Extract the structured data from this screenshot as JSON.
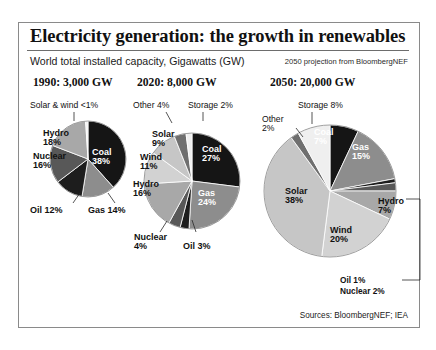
{
  "header": {
    "title": "Electricity generation: the growth in renewables",
    "subtitle": "World total installed capacity, Gigawatts (GW)",
    "note": "2050 projection from BloombergNEF"
  },
  "footer": {
    "sources": "Sources: BloombergNEF; IEA"
  },
  "panels": [
    {
      "heading": "1990: 3,000 GW"
    },
    {
      "heading": "2020: 8,000 GW"
    },
    {
      "heading": "2050: 20,000 GW"
    }
  ],
  "labels": {
    "p0": {
      "solarwind": "Solar & wind <1%",
      "hydro": "Hydro\n18%",
      "hydro_l1": "Hydro",
      "hydro_l2": "18%",
      "nuclear_l1": "Nuclear",
      "nuclear_l2": "16%",
      "oil": "Oil 12%",
      "gas": "Gas 14%",
      "coal_l1": "Coal",
      "coal_l2": "38%"
    },
    "p1": {
      "other": "Other 4%",
      "storage": "Storage 2%",
      "solar_l1": "Solar",
      "solar_l2": "9%",
      "wind_l1": "Wind",
      "wind_l2": "11%",
      "hydro_l1": "Hydro",
      "hydro_l2": "16%",
      "nuclear_l1": "Nuclear",
      "nuclear_l2": "4%",
      "oil": "Oil 3%",
      "gas_l1": "Gas",
      "gas_l2": "24%",
      "coal_l1": "Coal",
      "coal_l2": "27%"
    },
    "p2": {
      "storage": "Storage 8%",
      "other_l1": "Other",
      "other_l2": "2%",
      "solar_l1": "Solar",
      "solar_l2": "38%",
      "wind_l1": "Wind",
      "wind_l2": "20%",
      "hydro_l1": "Hydro",
      "hydro_l2": "7%",
      "oil": "Oil 1%",
      "nuclear": "Nuclear 2%",
      "gas_l1": "Gas",
      "gas_l2": "15%",
      "coal_l1": "Coal",
      "coal_l2": "7%"
    }
  },
  "colors": {
    "coal": "#151515",
    "gas": "#8d8d8d",
    "oil": "#1d1d1d",
    "nuclear": "#585858",
    "hydro": "#a8a8a8",
    "wind": "#d2d2d2",
    "solar": "#c6c6c6",
    "other": "#6f6f6f",
    "storage": "#efefef",
    "solarwind": "#f2f2f2",
    "frame": "#8a8a8a",
    "text": "#111111"
  },
  "chart_data": [
    {
      "type": "pie",
      "title": "1990: 3,000 GW",
      "total_gw": 3000,
      "unit": "GW",
      "categories": [
        "Coal",
        "Gas",
        "Oil",
        "Nuclear",
        "Hydro",
        "Solar & wind"
      ],
      "values": [
        38,
        14,
        12,
        16,
        18,
        1
      ],
      "value_labels": [
        "38%",
        "14%",
        "12%",
        "16%",
        "18%",
        "<1%"
      ],
      "start_angle_deg": 0,
      "direction": "clockwise",
      "legend": "inline-labels"
    },
    {
      "type": "pie",
      "title": "2020: 8,000 GW",
      "total_gw": 8000,
      "unit": "GW",
      "categories": [
        "Coal",
        "Gas",
        "Oil",
        "Nuclear",
        "Hydro",
        "Wind",
        "Solar",
        "Other",
        "Storage"
      ],
      "values": [
        27,
        24,
        3,
        4,
        16,
        11,
        9,
        4,
        2
      ],
      "value_labels": [
        "27%",
        "24%",
        "3%",
        "4%",
        "16%",
        "11%",
        "9%",
        "4%",
        "2%"
      ],
      "start_angle_deg": 0,
      "direction": "clockwise",
      "legend": "inline-labels"
    },
    {
      "type": "pie",
      "title": "2050: 20,000 GW",
      "total_gw": 20000,
      "unit": "GW",
      "categories": [
        "Coal",
        "Gas",
        "Oil",
        "Nuclear",
        "Hydro",
        "Wind",
        "Solar",
        "Other",
        "Storage"
      ],
      "values": [
        7,
        15,
        1,
        2,
        7,
        20,
        38,
        2,
        8
      ],
      "value_labels": [
        "7%",
        "15%",
        "1%",
        "2%",
        "7%",
        "20%",
        "38%",
        "2%",
        "8%"
      ],
      "start_angle_deg": 0,
      "direction": "clockwise",
      "legend": "inline-labels"
    }
  ]
}
